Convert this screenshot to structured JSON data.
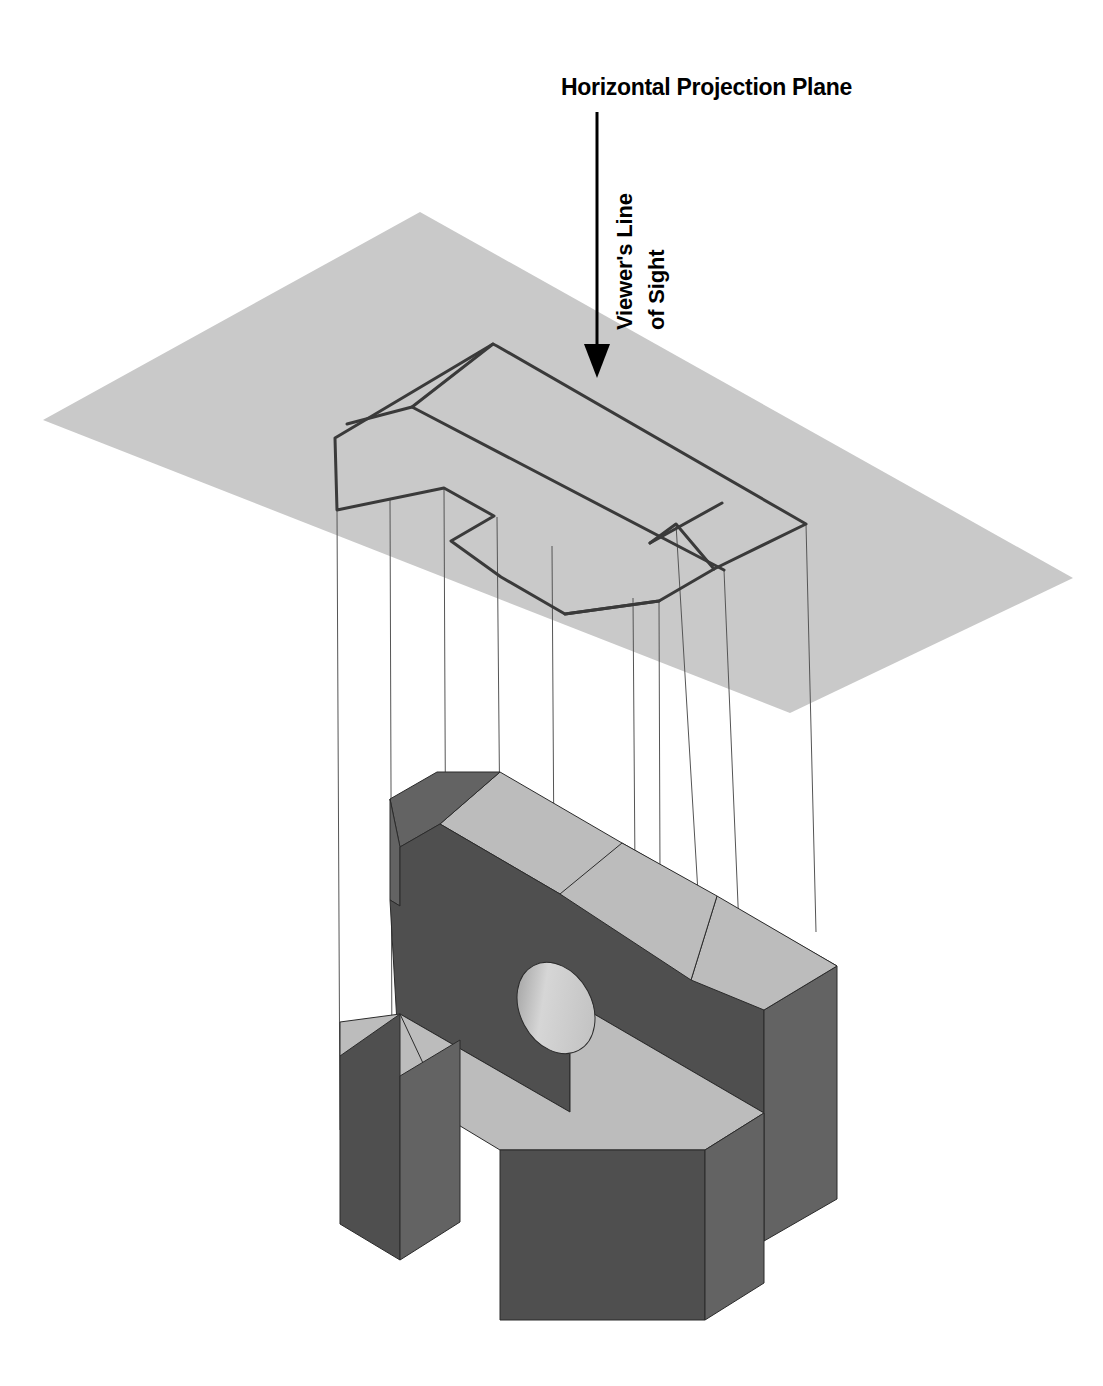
{
  "figure": {
    "kind": "orthographic-projection-diagram",
    "title_label": "Horizontal Projection Plane",
    "sight_label_line1": "Viewer's Line",
    "sight_label_line2": "of Sight",
    "background_color": "#ffffff",
    "plane_fill": "#c9c9c9",
    "outline_stroke": "#3a3a3a",
    "projector_stroke": "#555555",
    "solid_top_color": "#bcbcbc",
    "solid_front_color": "#4f4f4f",
    "solid_side_color": "#636363",
    "solid_edge_color": "#2b2b2b",
    "hole_color": "#cfcfcf",
    "arrow_color": "#000000"
  },
  "arrow": {
    "name": "viewers-line-of-sight-arrow",
    "x": 597,
    "y_start": 112,
    "y_end": 378,
    "head_width": 26,
    "head_length": 34
  },
  "projection_plane": {
    "name": "horizontal-projection-plane",
    "points": "420,212 1073,578 790,713 43,420"
  },
  "projected_outline": {
    "name": "top-view-outline-on-plane",
    "paths": [
      "M 493,344 L 335,438 L 337,510 L 444,488 L 494,516 L 451,541 L 501,577 L 565,614 L 659,601 L 714,569 L 806,524 L 497,346 Z",
      "M 493,344 L 412,407 L 347,424",
      "M 412,407 L 724,570",
      "M 714,569 L 676,524 L 650,543",
      "M 650,543 L 722,503",
      "M 565,614 L 659,601"
    ]
  },
  "projectors": {
    "name": "projection-lines",
    "lines": [
      {
        "x1": 337,
        "y1": 510,
        "x2": 340,
        "y2": 1130
      },
      {
        "x1": 390,
        "y1": 498,
        "x2": 392,
        "y2": 1072
      },
      {
        "x1": 444,
        "y1": 488,
        "x2": 447,
        "y2": 1160
      },
      {
        "x1": 497,
        "y1": 517,
        "x2": 504,
        "y2": 1265
      },
      {
        "x1": 552,
        "y1": 546,
        "x2": 556,
        "y2": 1172
      },
      {
        "x1": 633,
        "y1": 598,
        "x2": 636,
        "y2": 1008
      },
      {
        "x1": 659,
        "y1": 601,
        "x2": 661,
        "y2": 1145
      },
      {
        "x1": 676,
        "y1": 524,
        "x2": 710,
        "y2": 1094
      },
      {
        "x1": 724,
        "y1": 570,
        "x2": 742,
        "y2": 1000
      },
      {
        "x1": 806,
        "y1": 524,
        "x2": 816,
        "y2": 932
      }
    ]
  },
  "solid": {
    "name": "isometric-solid-object",
    "description": "Machined block with drilled hole, V-notch and stepped base",
    "faces": [
      {
        "name": "upper-top-face",
        "fill": "top",
        "points": "500,772 622,843 837,966 764,1010 560,894 440,824"
      },
      {
        "name": "upper-top-chamfer-face",
        "fill": "side",
        "points": "500,772 440,824 400,847 390,799 437,772"
      },
      {
        "name": "left-slope-face",
        "fill": "side",
        "points": "390,799 400,847 400,906 390,900"
      },
      {
        "name": "front-main-face",
        "fill": "front",
        "points": "390,900 400,906 400,847 440,824 560,894 764,1010 764,1113 570,1000 570,1112 400,1014 400,1076"
      },
      {
        "name": "right-side-face",
        "fill": "side",
        "points": "764,1010 837,966 837,1199 764,1241"
      },
      {
        "name": "vnotch-right-inner",
        "fill": "top",
        "points": "764,1010 837,966 717,896 691,980"
      },
      {
        "name": "vnotch-left-inner",
        "fill": "top",
        "points": "691,980 717,896 622,843 560,894"
      },
      {
        "name": "step-top-face",
        "fill": "top",
        "points": "400,1014 570,1112 570,1000 764,1113 705,1150 500,1150 437,1112 340,1056"
      },
      {
        "name": "step-left-top",
        "fill": "top",
        "points": "340,1056 437,1112 437,1093 400,1014 340,1022"
      },
      {
        "name": "base-front-face",
        "fill": "front",
        "points": "400,1076 400,1014 340,1056 340,1224 400,1260"
      },
      {
        "name": "base-left-face",
        "fill": "side",
        "points": "400,1076 400,1260 460,1222 460,1040"
      },
      {
        "name": "lower-block-front",
        "fill": "front",
        "points": "500,1150 500,1320 705,1320 705,1150"
      },
      {
        "name": "lower-block-side",
        "fill": "side",
        "points": "705,1150 705,1320 764,1283 764,1113"
      }
    ],
    "hole": {
      "name": "drilled-hole",
      "cx": 556,
      "cy": 1008,
      "rx": 36,
      "ry": 48,
      "rotation": -28
    }
  }
}
